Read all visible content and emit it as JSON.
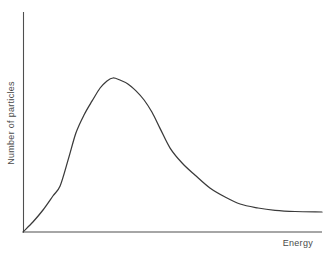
{
  "chart_data": {
    "type": "line",
    "title": "",
    "xlabel": "Energy",
    "ylabel": "Number of particles",
    "xlim": [
      0,
      1
    ],
    "ylim": [
      0,
      1.15
    ],
    "grid": false,
    "legend": false,
    "axis_ticks": false,
    "series": [
      {
        "name": "energy-distribution",
        "x": [
          0.0,
          0.033,
          0.067,
          0.1,
          0.124,
          0.151,
          0.177,
          0.204,
          0.231,
          0.258,
          0.281,
          0.301,
          0.324,
          0.351,
          0.378,
          0.405,
          0.431,
          0.458,
          0.492,
          0.532,
          0.575,
          0.625,
          0.676,
          0.726,
          0.786,
          0.843,
          0.91,
          1.0
        ],
        "y": [
          0.0,
          0.065,
          0.143,
          0.234,
          0.299,
          0.468,
          0.643,
          0.76,
          0.851,
          0.935,
          0.981,
          1.0,
          0.987,
          0.961,
          0.916,
          0.857,
          0.779,
          0.675,
          0.545,
          0.448,
          0.37,
          0.286,
          0.227,
          0.182,
          0.156,
          0.14,
          0.133,
          0.13
        ]
      }
    ]
  },
  "colors": {
    "background": "#ffffff",
    "curve": "#3a3a3a",
    "axis": "#4f4f4f",
    "label_text": "#4a4a4a"
  }
}
